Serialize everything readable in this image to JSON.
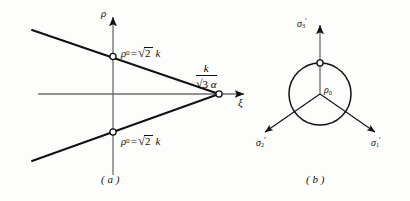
{
  "figure": {
    "width": 410,
    "height": 201,
    "background": "#fdfdfb",
    "ink_color": "#111111"
  },
  "panel_a": {
    "caption": "( a )",
    "caption_letter": "a",
    "vertical_axis_label": "ρ",
    "horizontal_axis_label": "ξ",
    "upper_vertex_label": {
      "symbol": "ρ",
      "subscript": "0",
      "equals": "=",
      "radicand": "2",
      "radical_sign": "√",
      "factor": "k",
      "full_text": "ρ₀ = √2 k"
    },
    "lower_vertex_label": {
      "symbol": "ρ",
      "subscript": "0",
      "equals": "=",
      "radicand": "2",
      "radical_sign": "√",
      "factor": "k",
      "full_text": "ρ₀ = √2 k"
    },
    "apex_label": {
      "numerator": "k",
      "denominator_radical": "√",
      "denominator_radicand": "3",
      "denominator_symbol": "α",
      "full_text": "k / (√3 α)"
    },
    "geometry": {
      "origin": [
        113,
        94
      ],
      "apex": [
        218,
        94
      ],
      "upper_vertex": [
        113,
        56
      ],
      "lower_vertex": [
        113,
        132
      ],
      "upper_line_start": [
        32,
        30
      ],
      "lower_line_start": [
        32,
        161
      ],
      "x_axis_start": [
        38,
        94
      ],
      "x_axis_end": [
        248,
        94
      ],
      "y_axis_top": [
        113,
        14
      ],
      "y_axis_bottom": [
        113,
        175
      ]
    }
  },
  "panel_b": {
    "caption": "( b )",
    "caption_letter": "b",
    "center_label": {
      "symbol": "ρ",
      "subscript": "0",
      "full_text": "ρ₀"
    },
    "axes": [
      {
        "name": "sigma-1-prime",
        "symbol": "σ",
        "subscript": "1",
        "prime": "′",
        "full_text": "σ₁′",
        "direction_deg": -30
      },
      {
        "name": "sigma-2-prime",
        "symbol": "σ",
        "subscript": "2",
        "prime": "′",
        "full_text": "σ₂′",
        "direction_deg": 210
      },
      {
        "name": "sigma-3-prime",
        "symbol": "σ",
        "subscript": "3",
        "prime": "′",
        "full_text": "σ₃′",
        "direction_deg": 90
      }
    ],
    "geometry": {
      "center": [
        320,
        94
      ],
      "radius": 31,
      "axis_top_end": [
        320,
        22
      ],
      "axis_bottom_left_end": [
        262,
        135
      ],
      "axis_bottom_right_end": [
        382,
        135
      ],
      "circle_top_marker": [
        320,
        63
      ]
    }
  }
}
